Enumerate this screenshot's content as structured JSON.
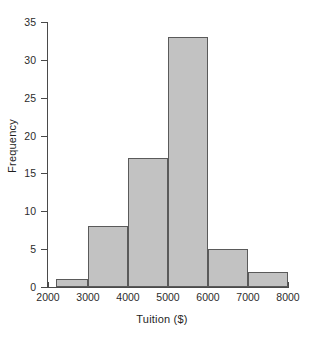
{
  "chart_data": {
    "type": "bar",
    "title": "",
    "subtitle": "",
    "xlabel": "Tuition ($)",
    "ylabel": "Frequency",
    "xlim": [
      2000,
      8000
    ],
    "ylim": [
      0,
      35
    ],
    "xticks": [
      2000,
      3000,
      4000,
      5000,
      6000,
      7000,
      8000
    ],
    "xtick_labels": [
      "2000",
      "3000",
      "4000",
      "5000",
      "6000",
      "7000",
      "8000"
    ],
    "yticks": [
      0,
      5,
      10,
      15,
      20,
      25,
      30,
      35
    ],
    "ytick_labels": [
      "0",
      "5",
      "10",
      "15",
      "20",
      "25",
      "30",
      "35"
    ],
    "grid": false,
    "legend": null,
    "bar_fill_color": "#c2c2c2",
    "bar_edge_color": "#5a5a5a",
    "axis_color": "#4a4a4a",
    "background_color": "#ffffff",
    "bins": [
      {
        "label": "2200-3000",
        "left": 2200,
        "right": 3000,
        "value": 1
      },
      {
        "label": "3000-4000",
        "left": 3000,
        "right": 4000,
        "value": 8
      },
      {
        "label": "4000-5000",
        "left": 4000,
        "right": 5000,
        "value": 17
      },
      {
        "label": "5000-6000",
        "left": 5000,
        "right": 6000,
        "value": 33
      },
      {
        "label": "6000-7000",
        "left": 6000,
        "right": 7000,
        "value": 5
      },
      {
        "label": "7000-8000",
        "left": 7000,
        "right": 8000,
        "value": 2
      }
    ],
    "categories": [
      "2200-3000",
      "3000-4000",
      "4000-5000",
      "5000-6000",
      "6000-7000",
      "7000-8000"
    ],
    "values": [
      1,
      8,
      17,
      33,
      5,
      2
    ]
  }
}
